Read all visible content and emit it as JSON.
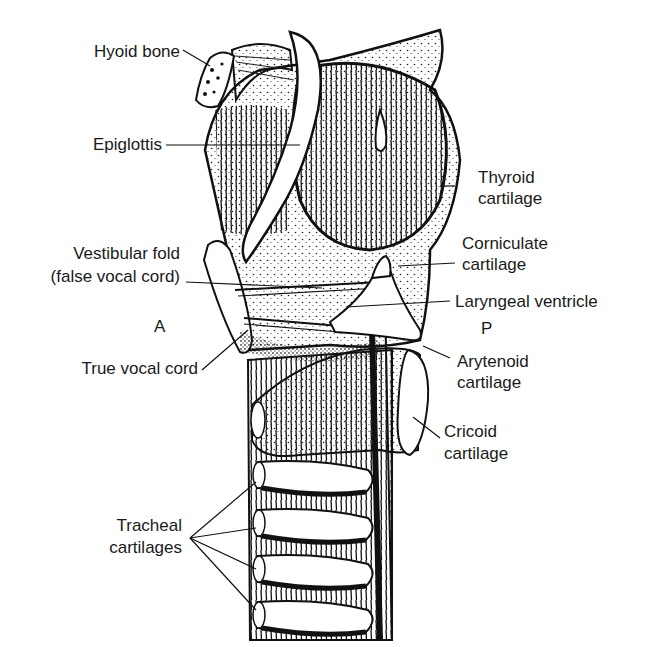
{
  "diagram": {
    "type": "anatomical illustration",
    "orientation": {
      "anterior": "A",
      "posterior": "P"
    },
    "labels": {
      "hyoid_bone": "Hyoid bone",
      "epiglottis": "Epiglottis",
      "thyroid_cartilage_1": "Thyroid",
      "thyroid_cartilage_2": "cartilage",
      "vestibular_fold_1": "Vestibular fold",
      "vestibular_fold_2": "(false vocal cord)",
      "corniculate_cartilage_1": "Corniculate",
      "corniculate_cartilage_2": "cartilage",
      "laryngeal_ventricle": "Laryngeal ventricle",
      "anterior": "A",
      "posterior": "P",
      "true_vocal_cord": "True vocal cord",
      "arytenoid_cartilage_1": "Arytenoid",
      "arytenoid_cartilage_2": "cartilage",
      "cricoid_cartilage_1": "Cricoid",
      "cricoid_cartilage_2": "cartilage",
      "tracheal_cartilages_1": "Tracheal",
      "tracheal_cartilages_2": "cartilages"
    },
    "colors": {
      "ink": "#111111",
      "background": "#ffffff",
      "text": "#1a1a1a"
    }
  }
}
